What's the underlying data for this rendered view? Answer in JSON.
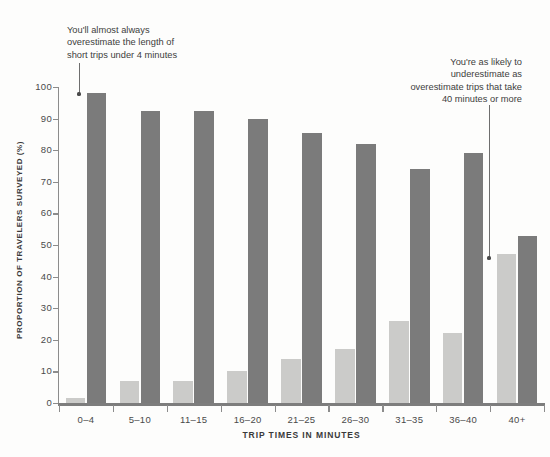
{
  "chart_data": {
    "type": "bar",
    "title": "",
    "subtitle": "",
    "xlabel": "TRIP TIMES IN MINUTES",
    "ylabel": "PROPORTION OF TRAVELERS SURVEYED (%)",
    "categories": [
      "0–4",
      "5–10",
      "11–15",
      "16–20",
      "21–25",
      "26–30",
      "31–35",
      "36–40",
      "40+"
    ],
    "series": [
      {
        "name": "underestimate",
        "color": "#cbcbc9",
        "values": [
          1.5,
          7,
          7,
          10,
          14,
          17,
          26,
          22,
          47
        ]
      },
      {
        "name": "overestimate",
        "color": "#7b7b7b",
        "values": [
          98,
          92.5,
          92.5,
          90,
          85.5,
          82,
          74,
          79,
          53
        ]
      }
    ],
    "ylim": [
      0,
      100
    ],
    "yticks": [
      0,
      10,
      20,
      30,
      40,
      50,
      60,
      70,
      80,
      90,
      100
    ],
    "ytick_labels": [
      "0",
      "10",
      "20",
      "30",
      "40",
      "50",
      "60",
      "70",
      "80",
      "90",
      "100"
    ],
    "grid": false,
    "legend": "none",
    "annotations": [
      {
        "id": "left",
        "text": "You'll almost always\noverestimate the length of\nshort trips under 4 minutes",
        "points_to_category": "0–4",
        "points_to_series": "overestimate",
        "points_to_value": 96
      },
      {
        "id": "right",
        "text": "You're as likely to\nunderestimate as\noverestimate trips that take\n40 minutes or more",
        "points_to_category": "40+",
        "points_to_series": "underestimate",
        "points_to_value": 46
      }
    ]
  },
  "colors": {
    "background": "#fdfdfc",
    "axis": "#8c8c8c",
    "text": "#3d3d3d",
    "bar_underestimate": "#cbcbc9",
    "bar_overestimate": "#7b7b7b"
  }
}
